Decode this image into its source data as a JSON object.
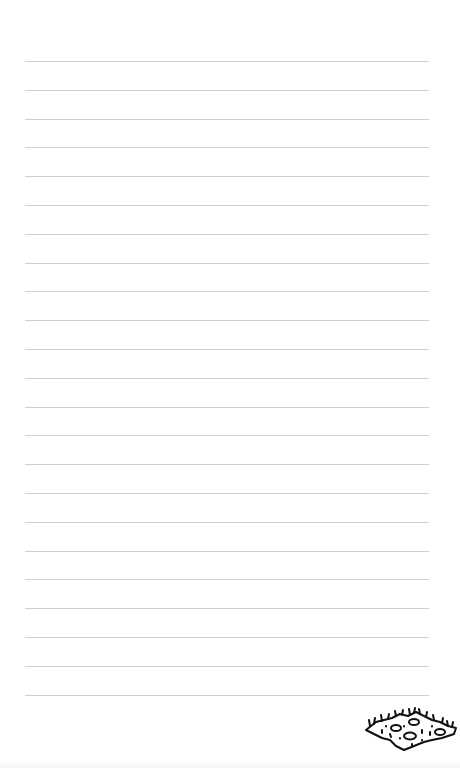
{
  "page": {
    "type": "lined-notepaper",
    "background_color": "#ffffff",
    "rule_color": "#cfcfcf",
    "rule_count": 23,
    "rule_first_y": 61,
    "rule_spacing": 28.8,
    "rule_left_x": 25,
    "rule_right_x": 429
  },
  "decoration": {
    "icon": "grass-soil-patch-icon",
    "stroke_color": "#111111",
    "position": "bottom-right"
  }
}
